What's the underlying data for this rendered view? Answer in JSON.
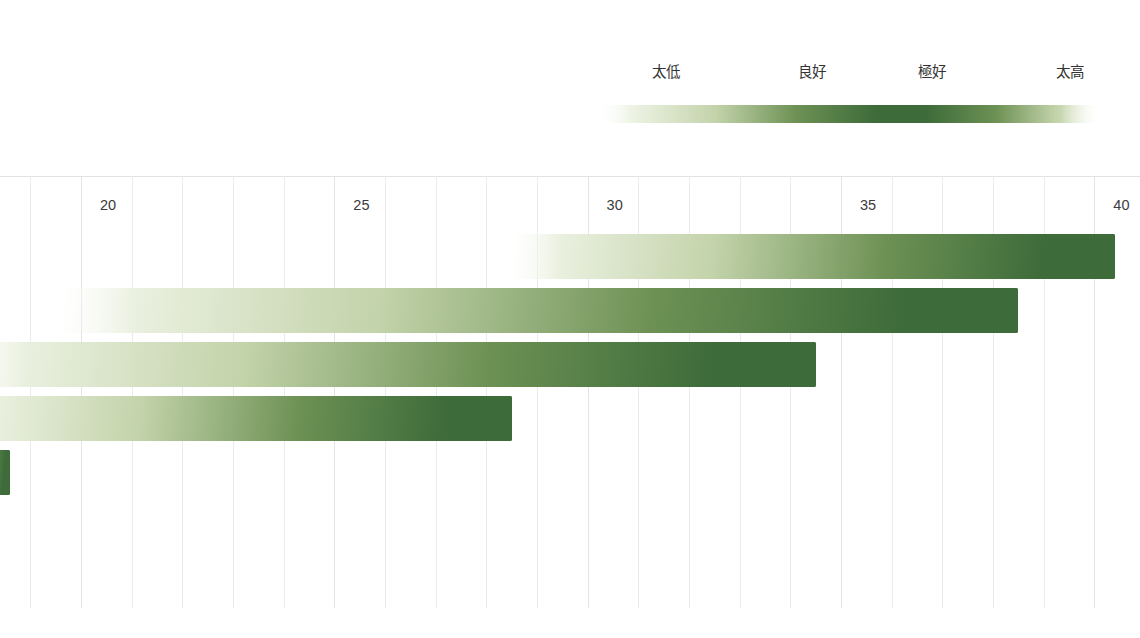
{
  "chart_data": {
    "type": "bar",
    "orientation": "horizontal",
    "title": "",
    "subtitle": "",
    "xlabel": "",
    "ylabel": "",
    "xlim": [
      18.4,
      40.9
    ],
    "xticks": [
      20,
      25,
      30,
      35,
      40
    ],
    "xtick_labels": [
      "20",
      "25",
      "30",
      "35",
      "40"
    ],
    "gridline_step": 1,
    "grid": true,
    "categories": [
      "1",
      "2",
      "3",
      "4",
      "5"
    ],
    "series": [
      {
        "name": "range",
        "bars": [
          {
            "category": "1",
            "start": 28.4,
            "end": 40.4,
            "value": 40.4
          },
          {
            "category": "2",
            "start": 19.4,
            "end": 38.5,
            "value": 38.5
          },
          {
            "category": "3",
            "start": 17.4,
            "end": 34.5,
            "value": 34.5
          },
          {
            "category": "4",
            "start": 17.4,
            "end": 28.5,
            "value": 28.5
          },
          {
            "category": "5",
            "start": 17.4,
            "end": 18.6,
            "value": 18.6
          }
        ]
      }
    ],
    "legend": {
      "position": "top-right",
      "type": "gradient-scale",
      "entries": [
        {
          "label": "太低",
          "meaning": "too-low",
          "position": 0.07
        },
        {
          "label": "良好",
          "meaning": "good",
          "position": 0.36
        },
        {
          "label": "極好",
          "meaning": "excellent",
          "position": 0.64
        },
        {
          "label": "太高",
          "meaning": "too-high",
          "position": 0.93
        }
      ]
    }
  },
  "colors": {
    "dark_green": "#3d6b39",
    "mid_green": "#6d9155",
    "light_green": "#c3d3aa",
    "pale_green": "#eef3e5",
    "background": "#ffffff",
    "gridline": "#ebebed",
    "axis_line": "#e2e2e4",
    "tick_text": "#3b3b3b",
    "legend_text": "#333333"
  },
  "legend": {
    "labels": [
      "太低",
      "良好",
      "極好",
      "太高"
    ]
  },
  "axis": {
    "tick_labels": [
      "20",
      "25",
      "30",
      "35",
      "40"
    ]
  }
}
